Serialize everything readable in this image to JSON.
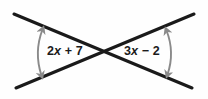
{
  "figure": {
    "type": "geometry-diagram",
    "background_color": "#fefefe",
    "line_color": "#1a1a1a",
    "arc_color": "#8a8a8a",
    "text_color": "#1b1b1b"
  },
  "labels": {
    "left_angle": {
      "full": "2x + 7",
      "coefficient": "2",
      "variable": "x",
      "operator": "+",
      "constant": "7"
    },
    "right_angle": {
      "full": "3x − 2",
      "coefficient": "3",
      "variable": "x",
      "operator": "−",
      "constant": "2"
    }
  },
  "geometry": {
    "intersection": {
      "x": 104,
      "y": 52
    },
    "line_1": {
      "from": {
        "x": 14,
        "y": 14
      },
      "to": {
        "x": 192,
        "y": 88
      }
    },
    "line_2": {
      "from": {
        "x": 194,
        "y": 14
      },
      "to": {
        "x": 16,
        "y": 88
      }
    },
    "arc_left": {
      "center_x": 104,
      "center_y": 52,
      "radius": 68
    },
    "arc_right": {
      "center_x": 104,
      "center_y": 52,
      "radius": 64
    }
  }
}
